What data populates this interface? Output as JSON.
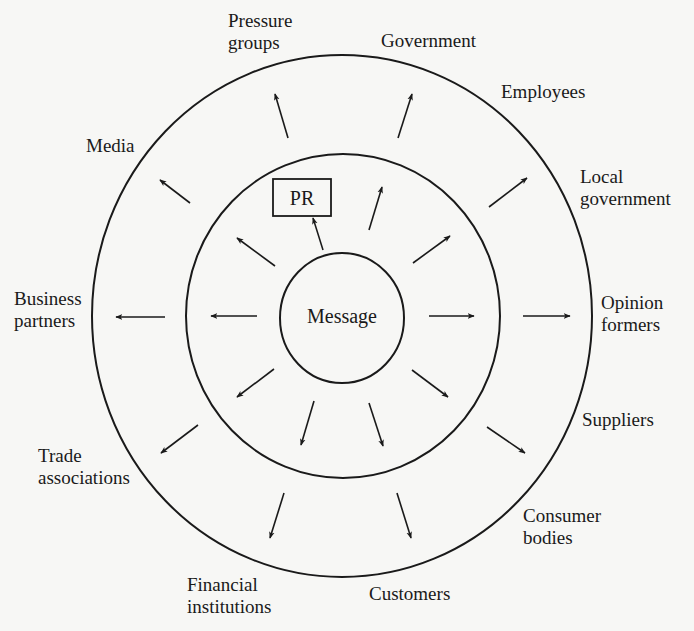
{
  "diagram": {
    "colors": {
      "background": "#f7f7f5",
      "ink": "#1a1a1a"
    },
    "center": {
      "label": "Message",
      "x": 342,
      "y": 323
    },
    "pr_box": {
      "label": "PR",
      "x": 273,
      "y": 179,
      "width": 58,
      "height": 37
    },
    "rings": [
      {
        "name": "inner-ring",
        "cx": 342,
        "cy": 318,
        "rx": 62,
        "ry": 65
      },
      {
        "name": "middle-ring",
        "cx": 343,
        "cy": 316,
        "rx": 157,
        "ry": 162
      },
      {
        "name": "outer-ring",
        "cx": 342,
        "cy": 316,
        "rx": 250,
        "ry": 261
      }
    ],
    "stakeholders": [
      {
        "id": "pressure-groups",
        "lines": [
          "Pressure",
          "groups"
        ],
        "x": 228,
        "y": 27
      },
      {
        "id": "government",
        "lines": [
          "Government"
        ],
        "x": 381,
        "y": 47
      },
      {
        "id": "employees",
        "lines": [
          "Employees"
        ],
        "x": 501,
        "y": 98
      },
      {
        "id": "media",
        "lines": [
          "Media"
        ],
        "x": 86,
        "y": 152
      },
      {
        "id": "local-government",
        "lines": [
          "Local",
          "government"
        ],
        "x": 580,
        "y": 183
      },
      {
        "id": "business-partners",
        "lines": [
          "Business",
          "partners"
        ],
        "x": 14,
        "y": 305
      },
      {
        "id": "opinion-formers",
        "lines": [
          "Opinion",
          "formers"
        ],
        "x": 601,
        "y": 309
      },
      {
        "id": "suppliers",
        "lines": [
          "Suppliers"
        ],
        "x": 582,
        "y": 426
      },
      {
        "id": "trade-associations",
        "lines": [
          "Trade",
          "associations"
        ],
        "x": 38,
        "y": 462
      },
      {
        "id": "consumer-bodies",
        "lines": [
          "Consumer",
          "bodies"
        ],
        "x": 523,
        "y": 522
      },
      {
        "id": "financial-institutions",
        "lines": [
          "Financial",
          "institutions"
        ],
        "x": 187,
        "y": 591
      },
      {
        "id": "customers",
        "lines": [
          "Customers"
        ],
        "x": 369,
        "y": 600
      }
    ],
    "arrows": [
      {
        "ring": "inner",
        "x1": 323,
        "y1": 250,
        "x2": 313,
        "y2": 218,
        "points_to": "PR"
      },
      {
        "ring": "inner",
        "x1": 275,
        "y1": 266,
        "x2": 237,
        "y2": 238
      },
      {
        "ring": "inner",
        "x1": 369,
        "y1": 230,
        "x2": 382,
        "y2": 187
      },
      {
        "ring": "inner",
        "x1": 413,
        "y1": 263,
        "x2": 450,
        "y2": 236
      },
      {
        "ring": "inner",
        "x1": 257,
        "y1": 316,
        "x2": 211,
        "y2": 316
      },
      {
        "ring": "inner",
        "x1": 429,
        "y1": 316,
        "x2": 474,
        "y2": 316
      },
      {
        "ring": "inner",
        "x1": 274,
        "y1": 369,
        "x2": 237,
        "y2": 397
      },
      {
        "ring": "inner",
        "x1": 314,
        "y1": 401,
        "x2": 301,
        "y2": 445
      },
      {
        "ring": "inner",
        "x1": 369,
        "y1": 403,
        "x2": 383,
        "y2": 446
      },
      {
        "ring": "inner",
        "x1": 412,
        "y1": 370,
        "x2": 448,
        "y2": 397
      },
      {
        "ring": "outer",
        "x1": 288,
        "y1": 138,
        "x2": 275,
        "y2": 94
      },
      {
        "ring": "outer",
        "x1": 190,
        "y1": 203,
        "x2": 160,
        "y2": 180
      },
      {
        "ring": "outer",
        "x1": 398,
        "y1": 138,
        "x2": 412,
        "y2": 94
      },
      {
        "ring": "outer",
        "x1": 489,
        "y1": 207,
        "x2": 527,
        "y2": 178
      },
      {
        "ring": "outer",
        "x1": 165,
        "y1": 317,
        "x2": 116,
        "y2": 317
      },
      {
        "ring": "outer",
        "x1": 523,
        "y1": 316,
        "x2": 570,
        "y2": 316
      },
      {
        "ring": "outer",
        "x1": 198,
        "y1": 425,
        "x2": 161,
        "y2": 453
      },
      {
        "ring": "outer",
        "x1": 487,
        "y1": 427,
        "x2": 525,
        "y2": 453
      },
      {
        "ring": "outer",
        "x1": 284,
        "y1": 493,
        "x2": 270,
        "y2": 538
      },
      {
        "ring": "outer",
        "x1": 397,
        "y1": 493,
        "x2": 411,
        "y2": 538
      }
    ]
  }
}
